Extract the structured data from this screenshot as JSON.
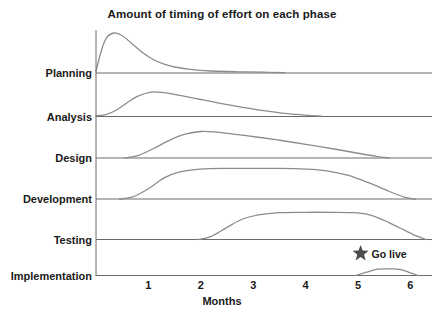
{
  "chart_data": {
    "type": "area",
    "title": "Amount of timing of effort on each phase",
    "subtitle": "",
    "xlabel": "Months",
    "ylabel": "",
    "xlim": [
      0,
      6.5
    ],
    "grid": false,
    "legend": "none",
    "x_ticks": [
      1,
      2,
      3,
      4,
      5,
      6
    ],
    "x_tick_labels": [
      "1",
      "2",
      "3",
      "4",
      "5",
      "6"
    ],
    "categories": [
      "Planning",
      "Analysis",
      "Design",
      "Development",
      "Testing",
      "Implementation"
    ],
    "series": [
      {
        "name": "Planning",
        "peak_month": 0.35,
        "peak_effort": 1.0,
        "start_month": 0.0,
        "end_month": 3.6,
        "points": [
          [
            0.0,
            0.05
          ],
          [
            0.1,
            0.55
          ],
          [
            0.2,
            0.88
          ],
          [
            0.35,
            1.0
          ],
          [
            0.5,
            0.93
          ],
          [
            0.7,
            0.72
          ],
          [
            0.9,
            0.5
          ],
          [
            1.1,
            0.33
          ],
          [
            1.3,
            0.22
          ],
          [
            1.5,
            0.15
          ],
          [
            1.8,
            0.09
          ],
          [
            2.2,
            0.05
          ],
          [
            2.7,
            0.03
          ],
          [
            3.2,
            0.02
          ],
          [
            3.6,
            0.01
          ]
        ]
      },
      {
        "name": "Analysis",
        "peak_month": 1.05,
        "peak_effort": 0.72,
        "start_month": 0.0,
        "end_month": 4.3,
        "points": [
          [
            0.0,
            0.02
          ],
          [
            0.2,
            0.06
          ],
          [
            0.4,
            0.2
          ],
          [
            0.6,
            0.41
          ],
          [
            0.8,
            0.6
          ],
          [
            1.05,
            0.72
          ],
          [
            1.3,
            0.7
          ],
          [
            1.6,
            0.62
          ],
          [
            2.0,
            0.5
          ],
          [
            2.4,
            0.38
          ],
          [
            2.8,
            0.27
          ],
          [
            3.2,
            0.17
          ],
          [
            3.6,
            0.09
          ],
          [
            4.0,
            0.04
          ],
          [
            4.3,
            0.01
          ]
        ]
      },
      {
        "name": "Design",
        "peak_month": 2.0,
        "peak_effort": 0.78,
        "start_month": 0.55,
        "end_month": 5.6,
        "points": [
          [
            0.55,
            0.0
          ],
          [
            0.8,
            0.07
          ],
          [
            1.1,
            0.28
          ],
          [
            1.4,
            0.52
          ],
          [
            1.7,
            0.7
          ],
          [
            2.0,
            0.78
          ],
          [
            2.3,
            0.76
          ],
          [
            2.7,
            0.69
          ],
          [
            3.1,
            0.61
          ],
          [
            3.6,
            0.5
          ],
          [
            4.1,
            0.38
          ],
          [
            4.6,
            0.25
          ],
          [
            5.0,
            0.14
          ],
          [
            5.35,
            0.05
          ],
          [
            5.6,
            0.0
          ]
        ]
      },
      {
        "name": "Development",
        "peak_month": 3.0,
        "peak_effort": 0.9,
        "start_month": 0.45,
        "end_month": 6.1,
        "points": [
          [
            0.45,
            0.0
          ],
          [
            0.7,
            0.06
          ],
          [
            1.0,
            0.3
          ],
          [
            1.3,
            0.62
          ],
          [
            1.6,
            0.8
          ],
          [
            2.0,
            0.88
          ],
          [
            2.5,
            0.9
          ],
          [
            3.0,
            0.9
          ],
          [
            3.5,
            0.9
          ],
          [
            4.0,
            0.88
          ],
          [
            4.4,
            0.83
          ],
          [
            4.8,
            0.7
          ],
          [
            5.2,
            0.48
          ],
          [
            5.6,
            0.22
          ],
          [
            5.9,
            0.05
          ],
          [
            6.1,
            0.0
          ]
        ]
      },
      {
        "name": "Testing",
        "peak_month": 4.0,
        "peak_effort": 0.85,
        "start_month": 1.95,
        "end_month": 6.3,
        "points": [
          [
            1.95,
            0.0
          ],
          [
            2.2,
            0.1
          ],
          [
            2.5,
            0.38
          ],
          [
            2.8,
            0.64
          ],
          [
            3.1,
            0.77
          ],
          [
            3.5,
            0.84
          ],
          [
            4.0,
            0.85
          ],
          [
            4.5,
            0.85
          ],
          [
            4.9,
            0.84
          ],
          [
            5.2,
            0.78
          ],
          [
            5.5,
            0.6
          ],
          [
            5.8,
            0.36
          ],
          [
            6.1,
            0.12
          ],
          [
            6.3,
            0.0
          ]
        ]
      },
      {
        "name": "Implementation",
        "peak_month": 5.5,
        "peak_effort": 0.3,
        "start_month": 4.95,
        "end_month": 6.15,
        "points": [
          [
            4.95,
            0.0
          ],
          [
            5.15,
            0.14
          ],
          [
            5.35,
            0.28
          ],
          [
            5.6,
            0.3
          ],
          [
            5.8,
            0.28
          ],
          [
            6.0,
            0.12
          ],
          [
            6.15,
            0.0
          ]
        ]
      }
    ],
    "annotations": [
      {
        "name": "go-live",
        "label": "Go live",
        "icon": "star-icon",
        "month": 5.05,
        "row": "Implementation",
        "color": "#4d4d4d"
      }
    ],
    "colors": {
      "curve": "#8c8c8c",
      "axis": "#595959",
      "text": "#1a1a1a",
      "background": "#ffffff",
      "star": "#4d4d4d"
    }
  }
}
